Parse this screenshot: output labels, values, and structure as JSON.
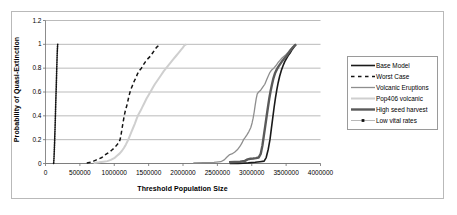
{
  "chart_data": {
    "type": "line",
    "title": "",
    "xlabel": "Threshold Population Size",
    "ylabel": "Probability of Quasi-Extinction",
    "xlim": [
      0,
      4000000
    ],
    "ylim": [
      0,
      1.2
    ],
    "grid": "horizontal",
    "legend_position": "right",
    "xticks": [
      "0",
      "500000",
      "1000000",
      "1500000",
      "2000000",
      "2500000",
      "3000000",
      "3500000",
      "4000000"
    ],
    "xtick_values": [
      0,
      500000,
      1000000,
      1500000,
      2000000,
      2500000,
      3000000,
      3500000,
      4000000
    ],
    "yticks": [
      "0",
      "0.2",
      "0.4",
      "0.6",
      "0.8",
      "1",
      "1.2"
    ],
    "ytick_values": [
      0,
      0.2,
      0.4,
      0.6,
      0.8,
      1,
      1.2
    ],
    "series": [
      {
        "name": "Base Model",
        "color": "#1a1a1a",
        "style": "solid",
        "width": 1.6,
        "points": [
          [
            2680000,
            0.0
          ],
          [
            2800000,
            0.0
          ],
          [
            2950000,
            0.005
          ],
          [
            3050000,
            0.01
          ],
          [
            3120000,
            0.015
          ],
          [
            3180000,
            0.02
          ],
          [
            3210000,
            0.05
          ],
          [
            3240000,
            0.12
          ],
          [
            3265000,
            0.2
          ],
          [
            3285000,
            0.29
          ],
          [
            3305000,
            0.38
          ],
          [
            3325000,
            0.47
          ],
          [
            3345000,
            0.55
          ],
          [
            3365000,
            0.62
          ],
          [
            3385000,
            0.68
          ],
          [
            3405000,
            0.73
          ],
          [
            3430000,
            0.78
          ],
          [
            3455000,
            0.82
          ],
          [
            3480000,
            0.855
          ],
          [
            3505000,
            0.88
          ],
          [
            3530000,
            0.905
          ],
          [
            3555000,
            0.925
          ],
          [
            3580000,
            0.95
          ],
          [
            3605000,
            0.97
          ],
          [
            3625000,
            0.985
          ],
          [
            3640000,
            1.0
          ]
        ]
      },
      {
        "name": "Worst Case",
        "color": "#141414",
        "style": "dashed",
        "width": 1.5,
        "points": [
          [
            600000,
            0.005
          ],
          [
            660000,
            0.01
          ],
          [
            700000,
            0.02
          ],
          [
            740000,
            0.03
          ],
          [
            780000,
            0.04
          ],
          [
            820000,
            0.05
          ],
          [
            860000,
            0.07
          ],
          [
            900000,
            0.085
          ],
          [
            940000,
            0.1
          ],
          [
            970000,
            0.115
          ],
          [
            1000000,
            0.13
          ],
          [
            1030000,
            0.15
          ],
          [
            1060000,
            0.17
          ],
          [
            1085000,
            0.2
          ],
          [
            1100000,
            0.245
          ],
          [
            1115000,
            0.3
          ],
          [
            1130000,
            0.35
          ],
          [
            1145000,
            0.4
          ],
          [
            1160000,
            0.44
          ],
          [
            1180000,
            0.48
          ],
          [
            1200000,
            0.53
          ],
          [
            1220000,
            0.58
          ],
          [
            1240000,
            0.62
          ],
          [
            1265000,
            0.655
          ],
          [
            1290000,
            0.69
          ],
          [
            1315000,
            0.72
          ],
          [
            1340000,
            0.755
          ],
          [
            1365000,
            0.78
          ],
          [
            1395000,
            0.8
          ],
          [
            1425000,
            0.83
          ],
          [
            1455000,
            0.855
          ],
          [
            1490000,
            0.88
          ],
          [
            1525000,
            0.9
          ],
          [
            1555000,
            0.925
          ],
          [
            1585000,
            0.95
          ],
          [
            1615000,
            0.975
          ],
          [
            1645000,
            0.99
          ],
          [
            1670000,
            1.0
          ]
        ]
      },
      {
        "name": "Volcanic Eruptions",
        "color": "#8e8e8e",
        "style": "solid",
        "width": 1.3,
        "points": [
          [
            2150000,
            0.005
          ],
          [
            2300000,
            0.007
          ],
          [
            2450000,
            0.01
          ],
          [
            2550000,
            0.015
          ],
          [
            2600000,
            0.03
          ],
          [
            2640000,
            0.055
          ],
          [
            2680000,
            0.075
          ],
          [
            2710000,
            0.08
          ],
          [
            2750000,
            0.095
          ],
          [
            2790000,
            0.115
          ],
          [
            2830000,
            0.145
          ],
          [
            2860000,
            0.175
          ],
          [
            2880000,
            0.2
          ],
          [
            2900000,
            0.215
          ],
          [
            2930000,
            0.24
          ],
          [
            2960000,
            0.27
          ],
          [
            2985000,
            0.3
          ],
          [
            3005000,
            0.34
          ],
          [
            3020000,
            0.38
          ],
          [
            3035000,
            0.43
          ],
          [
            3050000,
            0.49
          ],
          [
            3065000,
            0.545
          ],
          [
            3080000,
            0.585
          ],
          [
            3100000,
            0.6
          ],
          [
            3130000,
            0.615
          ],
          [
            3160000,
            0.64
          ],
          [
            3190000,
            0.665
          ],
          [
            3215000,
            0.7
          ],
          [
            3240000,
            0.735
          ],
          [
            3265000,
            0.765
          ],
          [
            3290000,
            0.785
          ],
          [
            3320000,
            0.8
          ],
          [
            3350000,
            0.82
          ],
          [
            3380000,
            0.845
          ],
          [
            3410000,
            0.865
          ],
          [
            3440000,
            0.885
          ],
          [
            3470000,
            0.9
          ],
          [
            3500000,
            0.915
          ],
          [
            3530000,
            0.935
          ],
          [
            3560000,
            0.955
          ],
          [
            3590000,
            0.975
          ],
          [
            3620000,
            0.99
          ],
          [
            3645000,
            1.0
          ]
        ]
      },
      {
        "name": "Pop406 volcanic",
        "color": "#cfcfcf",
        "style": "solid",
        "width": 2.0,
        "points": [
          [
            700000,
            0.005
          ],
          [
            780000,
            0.01
          ],
          [
            840000,
            0.015
          ],
          [
            900000,
            0.02
          ],
          [
            950000,
            0.03
          ],
          [
            1000000,
            0.045
          ],
          [
            1040000,
            0.065
          ],
          [
            1080000,
            0.085
          ],
          [
            1110000,
            0.105
          ],
          [
            1140000,
            0.13
          ],
          [
            1170000,
            0.16
          ],
          [
            1200000,
            0.195
          ],
          [
            1225000,
            0.23
          ],
          [
            1250000,
            0.265
          ],
          [
            1275000,
            0.3
          ],
          [
            1300000,
            0.335
          ],
          [
            1325000,
            0.375
          ],
          [
            1350000,
            0.41
          ],
          [
            1380000,
            0.44
          ],
          [
            1410000,
            0.475
          ],
          [
            1440000,
            0.51
          ],
          [
            1470000,
            0.545
          ],
          [
            1500000,
            0.575
          ],
          [
            1530000,
            0.605
          ],
          [
            1560000,
            0.635
          ],
          [
            1590000,
            0.665
          ],
          [
            1620000,
            0.69
          ],
          [
            1650000,
            0.715
          ],
          [
            1685000,
            0.745
          ],
          [
            1720000,
            0.775
          ],
          [
            1755000,
            0.8
          ],
          [
            1790000,
            0.825
          ],
          [
            1825000,
            0.85
          ],
          [
            1860000,
            0.875
          ],
          [
            1895000,
            0.9
          ],
          [
            1930000,
            0.925
          ],
          [
            1965000,
            0.95
          ],
          [
            1995000,
            0.97
          ],
          [
            2020000,
            0.99
          ],
          [
            2045000,
            1.0
          ]
        ]
      },
      {
        "name": "High seed harvest",
        "color": "#5a5a5a",
        "style": "solid",
        "width": 2.4,
        "points": [
          [
            2670000,
            0.01
          ],
          [
            2750000,
            0.012
          ],
          [
            2830000,
            0.015
          ],
          [
            2900000,
            0.022
          ],
          [
            2940000,
            0.035
          ],
          [
            2980000,
            0.04
          ],
          [
            3020000,
            0.042
          ],
          [
            3060000,
            0.045
          ],
          [
            3100000,
            0.05
          ],
          [
            3130000,
            0.08
          ],
          [
            3155000,
            0.15
          ],
          [
            3175000,
            0.23
          ],
          [
            3195000,
            0.31
          ],
          [
            3215000,
            0.39
          ],
          [
            3235000,
            0.47
          ],
          [
            3255000,
            0.545
          ],
          [
            3275000,
            0.61
          ],
          [
            3295000,
            0.665
          ],
          [
            3315000,
            0.715
          ],
          [
            3340000,
            0.76
          ],
          [
            3365000,
            0.79
          ],
          [
            3390000,
            0.815
          ],
          [
            3420000,
            0.84
          ],
          [
            3450000,
            0.865
          ],
          [
            3480000,
            0.885
          ],
          [
            3510000,
            0.905
          ],
          [
            3540000,
            0.93
          ],
          [
            3570000,
            0.955
          ],
          [
            3600000,
            0.975
          ],
          [
            3625000,
            0.99
          ],
          [
            3645000,
            1.0
          ]
        ]
      },
      {
        "name": "Low vital rates",
        "color": "#111111",
        "style": "dotted",
        "width": 1.6,
        "points": [
          [
            118000,
            0.0
          ],
          [
            120000,
            0.01
          ],
          [
            122000,
            0.03
          ],
          [
            124000,
            0.05
          ],
          [
            126000,
            0.08
          ],
          [
            128000,
            0.11
          ],
          [
            130000,
            0.14
          ],
          [
            132000,
            0.17
          ],
          [
            134000,
            0.2
          ],
          [
            136000,
            0.24
          ],
          [
            138000,
            0.28
          ],
          [
            140000,
            0.32
          ],
          [
            142000,
            0.36
          ],
          [
            144000,
            0.4
          ],
          [
            146000,
            0.44
          ],
          [
            148000,
            0.48
          ],
          [
            150000,
            0.52
          ],
          [
            152000,
            0.56
          ],
          [
            154000,
            0.6
          ],
          [
            156000,
            0.64
          ],
          [
            158000,
            0.68
          ],
          [
            160000,
            0.72
          ],
          [
            162000,
            0.76
          ],
          [
            164000,
            0.8
          ],
          [
            166000,
            0.84
          ],
          [
            168000,
            0.88
          ],
          [
            170000,
            0.92
          ],
          [
            173000,
            0.96
          ],
          [
            176000,
            0.99
          ],
          [
            178000,
            1.0
          ]
        ]
      }
    ]
  },
  "legend": {
    "items": [
      {
        "label": "Base Model"
      },
      {
        "label": "Worst Case"
      },
      {
        "label": "Volcanic Eruptions"
      },
      {
        "label": "Pop406 volcanic"
      },
      {
        "label": "High seed harvest"
      },
      {
        "label": "Low vital rates"
      }
    ]
  }
}
